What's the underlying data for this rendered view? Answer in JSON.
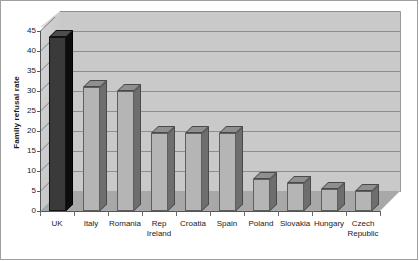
{
  "chart_data": {
    "type": "bar",
    "title": "",
    "xlabel": "",
    "ylabel": "Family refusal rate",
    "ylim": [
      0,
      45
    ],
    "ytick_step": 5,
    "grid": true,
    "legend": "none",
    "style": "3d-column",
    "categories": [
      "UK",
      "Italy",
      "Romania",
      "Rep\nIreland",
      "Croatia",
      "Spain",
      "Poland",
      "Slovakia",
      "Hungary",
      "Czech\nRepublic"
    ],
    "values": [
      43.5,
      31,
      30,
      19.5,
      19.5,
      19.5,
      8,
      7,
      5.5,
      5
    ],
    "yticks": [
      "0",
      "5",
      "10",
      "15",
      "20",
      "25",
      "30",
      "35",
      "40",
      "45"
    ],
    "highlight_index": 0,
    "colors": {
      "bar_face": "#b5b5b5",
      "bar_side": "#6e6e6e",
      "bar_top": "#8f8f8f",
      "highlight_face": "#3a3a3a",
      "highlight_side": "#0d0d0d",
      "wall": "#c9c9c9",
      "floor": "#a8a8a8",
      "gridline": "#8e8e8e",
      "text": "#1a1a1a",
      "background": "#ffffff"
    }
  }
}
